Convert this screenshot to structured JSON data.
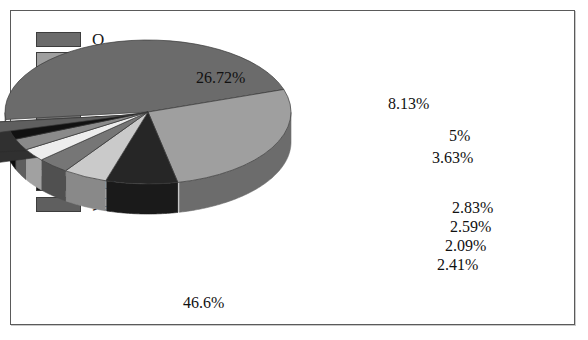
{
  "chart_data": {
    "type": "pie",
    "title": "",
    "labels": [
      "O",
      "Si",
      "Al",
      "Fe",
      "Ca",
      "Na",
      "K",
      "Mg",
      "其他"
    ],
    "values": [
      46.6,
      26.72,
      8.13,
      5,
      3.63,
      2.83,
      2.59,
      2.09,
      2.41
    ],
    "value_labels": [
      "46.6%",
      "26.72%",
      "8.13%",
      "5%",
      "3.63%",
      "2.83%",
      "2.59%",
      "2.09%",
      "2.41%"
    ],
    "colors": [
      "#6b6b6b",
      "#9f9f9f",
      "#262626",
      "#cacaca",
      "#767676",
      "#ededed",
      "#8a8a8a",
      "#111111",
      "#5f5f5f"
    ],
    "legend_position": "left",
    "three_d": true,
    "exploded_slice": "其他",
    "grid": false
  },
  "legend": {
    "items": [
      {
        "label": "O",
        "color": "#6b6b6b"
      },
      {
        "label": "Si",
        "color": "#9f9f9f"
      },
      {
        "label": "Al",
        "color": "#262626"
      },
      {
        "label": "Fe",
        "color": "#cacaca"
      },
      {
        "label": "Ca",
        "color": "#767676"
      },
      {
        "label": "Na",
        "color": "#ededed"
      },
      {
        "label": "K",
        "color": "#8a8a8a"
      },
      {
        "label": "Mg",
        "color": "#111111"
      },
      {
        "label": "其他",
        "color": "#5f5f5f"
      }
    ]
  },
  "callouts": {
    "o": "46.6%",
    "si": "26.72%",
    "al": "8.13%",
    "fe": "5%",
    "ca": "3.63%",
    "na": "2.83%",
    "k": "2.59%",
    "mg": "2.09%",
    "other": "2.41%"
  }
}
